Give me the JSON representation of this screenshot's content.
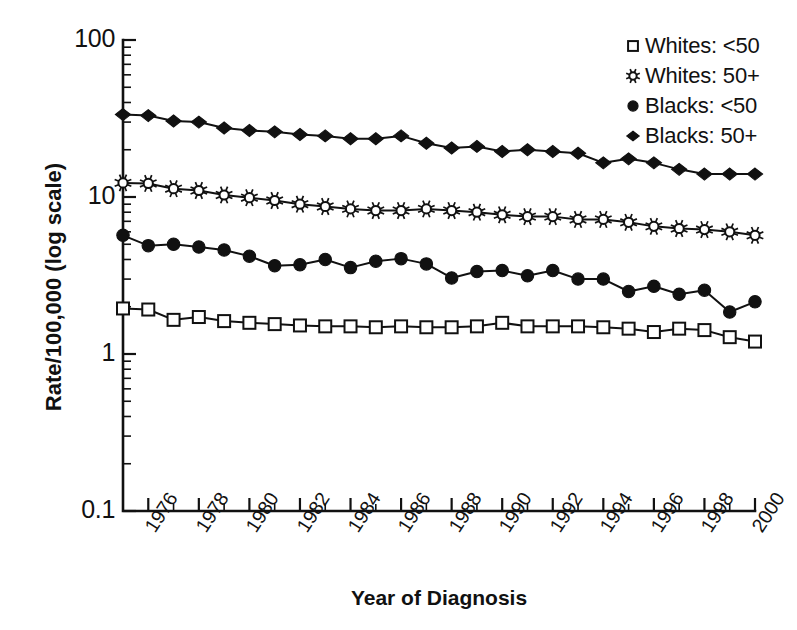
{
  "chart_data": {
    "type": "line",
    "title": "",
    "xlabel": "Year of Diagnosis",
    "ylabel": "Rate/100,000 (log scale)",
    "yscale": "log",
    "ylim": [
      0.1,
      100
    ],
    "ytick_labels": [
      "100",
      "10",
      "1",
      "0.1"
    ],
    "ytick_values": [
      100,
      10,
      1,
      0.1
    ],
    "xlim": [
      1975,
      2000
    ],
    "xtick_labels": [
      "1976",
      "1978",
      "1980",
      "1982",
      "1984",
      "1986",
      "1988",
      "1990",
      "1992",
      "1994",
      "1996",
      "1998",
      "2000"
    ],
    "xtick_values": [
      1976,
      1978,
      1980,
      1982,
      1984,
      1986,
      1988,
      1990,
      1992,
      1994,
      1996,
      1998,
      2000
    ],
    "x": [
      1975,
      1976,
      1977,
      1978,
      1979,
      1980,
      1981,
      1982,
      1983,
      1984,
      1985,
      1986,
      1987,
      1988,
      1989,
      1990,
      1991,
      1992,
      1993,
      1994,
      1995,
      1996,
      1997,
      1998,
      1999,
      2000
    ],
    "grid": false,
    "legend_position": "top-right",
    "series": [
      {
        "name": "Whites: <50",
        "marker": "open-square",
        "values": [
          1.95,
          1.92,
          1.65,
          1.72,
          1.62,
          1.58,
          1.55,
          1.52,
          1.5,
          1.5,
          1.48,
          1.5,
          1.48,
          1.48,
          1.5,
          1.58,
          1.5,
          1.5,
          1.5,
          1.48,
          1.45,
          1.38,
          1.45,
          1.42,
          1.28,
          1.2
        ]
      },
      {
        "name": "Whites: 50+",
        "marker": "open-star",
        "values": [
          12.3,
          12.2,
          11.3,
          11.0,
          10.3,
          9.9,
          9.5,
          9.0,
          8.7,
          8.4,
          8.2,
          8.2,
          8.4,
          8.2,
          8.0,
          7.7,
          7.5,
          7.5,
          7.2,
          7.2,
          6.9,
          6.5,
          6.3,
          6.2,
          6.0,
          5.7
        ]
      },
      {
        "name": "Blacks: <50",
        "marker": "filled-circle",
        "values": [
          5.7,
          4.9,
          5.0,
          4.8,
          4.6,
          4.2,
          3.65,
          3.7,
          4.0,
          3.55,
          3.9,
          4.05,
          3.75,
          3.05,
          3.35,
          3.4,
          3.15,
          3.4,
          3.0,
          3.0,
          2.5,
          2.7,
          2.4,
          2.55,
          1.85,
          2.15
        ]
      },
      {
        "name": "Blacks: 50+",
        "marker": "filled-diamond",
        "values": [
          33.5,
          33.0,
          30.5,
          30.0,
          27.5,
          26.5,
          26.0,
          25.0,
          24.5,
          23.5,
          23.5,
          24.5,
          22.0,
          20.5,
          21.0,
          19.5,
          20.0,
          19.5,
          19.0,
          16.5,
          17.5,
          16.5,
          15.0,
          14.0,
          14.0,
          14.0
        ]
      }
    ]
  }
}
